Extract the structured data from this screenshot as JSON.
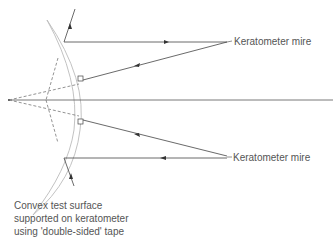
{
  "diagram": {
    "labels": {
      "mire_top": "Keratometer mire",
      "mire_bottom": "Keratometer mire",
      "caption_line1": "Convex test surface",
      "caption_line2": "supported on keratometer",
      "caption_line3": "using 'double-sided' tape"
    },
    "colors": {
      "line": "#444444",
      "lens": "#bbbbbb",
      "text": "#555555"
    }
  }
}
